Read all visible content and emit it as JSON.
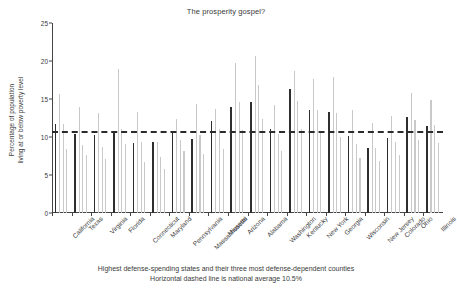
{
  "chart_data": {
    "type": "bar",
    "title": "The prosperity gospel?",
    "xlabel_line1": "Highest defense-spending states and their three most defense-dependent counties",
    "xlabel_line2": "Horizontal dashed line is national average 10.5%",
    "ylabel_line1": "Percentage of population",
    "ylabel_line2": "living at or below poverty level",
    "ylim": [
      0,
      25
    ],
    "yticks": [
      0,
      5,
      10,
      15,
      20,
      25
    ],
    "grid": false,
    "legend": "none",
    "national_average": 10.5,
    "series_names": [
      "State",
      "County 1",
      "County 2",
      "County 3"
    ],
    "state_color": "#2e2e2e",
    "county_color": "#c9c9c9",
    "average_line_color": "#2b2b2b",
    "categories": [
      "California",
      "Texas",
      "Virginia",
      "Florida",
      "Connecticut",
      "Maryland",
      "Pennsylvania",
      "Massachusetts",
      "Missouri",
      "Arizona",
      "Alabama",
      "Washington",
      "Kentucky",
      "New York",
      "Georgia",
      "Wisconsin",
      "New Jersey",
      "Colorado",
      "Ohio",
      "Illinois"
    ],
    "state_values": [
      11.7,
      10.4,
      10.3,
      10.7,
      9.2,
      9.3,
      10.5,
      9.7,
      12.1,
      13.9,
      14.6,
      11.1,
      16.3,
      13.6,
      13.3,
      10.1,
      8.6,
      9.9,
      12.6,
      11.4
    ],
    "county_values": [
      [
        15.6,
        11.7,
        8.4
      ],
      [
        14.0,
        8.9,
        7.6
      ],
      [
        13.1,
        8.7,
        7.1
      ],
      [
        18.9,
        11.0,
        9.1
      ],
      [
        13.3,
        9.3,
        6.7
      ],
      [
        9.4,
        7.4,
        5.8
      ],
      [
        12.4,
        9.6,
        8.2
      ],
      [
        14.3,
        10.2,
        7.8
      ],
      [
        13.7,
        11.0,
        8.4
      ],
      [
        19.8,
        14.6,
        10.9
      ],
      [
        20.6,
        16.8,
        12.4
      ],
      [
        14.2,
        10.4,
        8.1
      ],
      [
        18.7,
        14.7,
        11.1
      ],
      [
        17.6,
        13.6,
        10.6
      ],
      [
        17.9,
        13.1,
        10.0
      ],
      [
        13.6,
        9.1,
        7.2
      ],
      [
        11.9,
        8.5,
        6.9
      ],
      [
        12.8,
        9.4,
        7.6
      ],
      [
        15.8,
        12.2,
        9.6
      ],
      [
        14.9,
        11.6,
        9.2
      ]
    ]
  }
}
